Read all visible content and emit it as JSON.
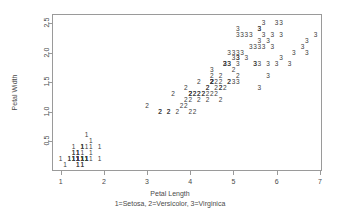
{
  "chart_data": {
    "type": "scatter",
    "title": "",
    "xlabel": "Petal Length",
    "ylabel": "Petal Width",
    "caption": "1=Setosa, 2=Versicolor, 3=Virginica",
    "xlim": [
      0.8,
      7.05
    ],
    "ylim": [
      0.0,
      2.65
    ],
    "xticks": [
      1,
      2,
      3,
      4,
      5,
      6,
      7
    ],
    "xticklabels": [
      "1",
      "2",
      "3",
      "4",
      "5",
      "6",
      "7"
    ],
    "yticks": [
      0.5,
      1.0,
      1.5,
      2.0,
      2.5
    ],
    "yticklabels": [
      "0.5",
      "1.0",
      "1.5",
      "2.0",
      "2.5"
    ],
    "grid": false,
    "legend": "none",
    "marker_style": "text-glyph-group-number",
    "point_color": "#3b3b3b",
    "axis_color": "#9a9a9a",
    "groups": [
      {
        "code": "1",
        "name": "Setosa"
      },
      {
        "code": "2",
        "name": "Versicolor"
      },
      {
        "code": "3",
        "name": "Virginica"
      }
    ],
    "series": [
      {
        "name": "Setosa",
        "label": "1",
        "x": [
          1.4,
          1.4,
          1.3,
          1.5,
          1.4,
          1.7,
          1.4,
          1.5,
          1.4,
          1.5,
          1.5,
          1.6,
          1.4,
          1.1,
          1.2,
          1.5,
          1.3,
          1.4,
          1.7,
          1.5,
          1.7,
          1.5,
          1.0,
          1.7,
          1.9,
          1.6,
          1.6,
          1.5,
          1.4,
          1.6,
          1.6,
          1.5,
          1.5,
          1.4,
          1.5,
          1.2,
          1.3,
          1.4,
          1.3,
          1.5,
          1.3,
          1.3,
          1.3,
          1.6,
          1.9,
          1.4,
          1.6,
          1.4,
          1.5,
          1.4
        ],
        "y": [
          0.2,
          0.2,
          0.2,
          0.2,
          0.2,
          0.4,
          0.3,
          0.2,
          0.2,
          0.1,
          0.2,
          0.2,
          0.1,
          0.1,
          0.2,
          0.4,
          0.4,
          0.3,
          0.3,
          0.3,
          0.2,
          0.4,
          0.2,
          0.5,
          0.2,
          0.2,
          0.4,
          0.2,
          0.2,
          0.2,
          0.2,
          0.4,
          0.1,
          0.2,
          0.2,
          0.2,
          0.2,
          0.1,
          0.2,
          0.2,
          0.3,
          0.3,
          0.2,
          0.6,
          0.4,
          0.3,
          0.2,
          0.2,
          0.2,
          0.2
        ]
      },
      {
        "name": "Versicolor",
        "label": "2",
        "x": [
          4.7,
          4.5,
          4.9,
          4.0,
          4.6,
          4.5,
          4.7,
          3.3,
          4.6,
          3.9,
          3.5,
          4.2,
          4.0,
          4.7,
          3.6,
          4.4,
          4.5,
          4.1,
          4.5,
          3.9,
          4.8,
          4.0,
          4.9,
          4.7,
          4.3,
          4.4,
          4.8,
          5.0,
          4.5,
          3.5,
          3.8,
          3.7,
          3.9,
          5.1,
          4.5,
          4.5,
          4.7,
          4.4,
          4.1,
          4.0,
          4.4,
          4.6,
          4.0,
          3.3,
          4.2,
          4.2,
          4.2,
          4.3,
          3.0,
          4.1
        ],
        "y": [
          1.4,
          1.5,
          1.5,
          1.3,
          1.5,
          1.3,
          1.6,
          1.0,
          1.3,
          1.4,
          1.0,
          1.5,
          1.0,
          1.4,
          1.3,
          1.4,
          1.5,
          1.0,
          1.5,
          1.1,
          1.8,
          1.3,
          1.5,
          1.2,
          1.3,
          1.4,
          1.4,
          1.7,
          1.5,
          1.0,
          1.1,
          1.0,
          1.2,
          1.6,
          1.5,
          1.6,
          1.5,
          1.3,
          1.3,
          1.3,
          1.2,
          1.4,
          1.2,
          1.0,
          1.3,
          1.2,
          1.3,
          1.3,
          1.1,
          1.3
        ]
      },
      {
        "name": "Virginica",
        "label": "3",
        "x": [
          6.0,
          5.1,
          5.9,
          5.6,
          5.8,
          6.6,
          4.5,
          6.3,
          5.8,
          6.1,
          5.1,
          5.3,
          5.5,
          5.0,
          5.1,
          5.3,
          5.5,
          6.7,
          6.9,
          5.0,
          5.7,
          4.9,
          6.7,
          4.9,
          5.7,
          6.0,
          4.8,
          4.9,
          5.6,
          5.8,
          6.1,
          6.4,
          5.6,
          5.1,
          5.6,
          6.1,
          5.6,
          5.5,
          4.8,
          5.4,
          5.6,
          5.1,
          5.1,
          5.9,
          5.7,
          5.2,
          5.0,
          5.2,
          5.4,
          5.1
        ],
        "y": [
          2.5,
          1.9,
          2.1,
          1.8,
          2.2,
          2.1,
          1.7,
          1.8,
          1.8,
          2.5,
          2.0,
          1.9,
          2.1,
          2.0,
          2.4,
          2.3,
          1.8,
          2.2,
          2.3,
          1.5,
          2.3,
          2.0,
          2.0,
          1.8,
          2.1,
          1.8,
          1.8,
          1.8,
          2.1,
          1.6,
          1.9,
          2.0,
          2.2,
          1.5,
          1.4,
          2.3,
          2.4,
          1.8,
          1.8,
          2.1,
          2.4,
          2.3,
          1.9,
          2.3,
          2.5,
          2.3,
          1.9,
          2.0,
          2.3,
          1.8
        ]
      }
    ]
  }
}
